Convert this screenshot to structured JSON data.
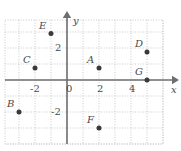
{
  "figure": {
    "type": "coordinate-plane-scatter",
    "axis_labels": {
      "x": "x",
      "y": "y"
    },
    "colors": {
      "grid": "#c9c9c9",
      "axis": "#6e6e6e",
      "point": "#3a3a3a",
      "label": "#4a4a4a",
      "background": "#ffffff"
    },
    "geometry": {
      "origin_px": {
        "x": 67,
        "y": 80
      },
      "unit_px": 16,
      "plot_left_px": 5,
      "plot_right_px": 163,
      "plot_top_px": 20,
      "plot_bottom_px": 144
    },
    "axis_ranges": {
      "x": [
        -4,
        6
      ],
      "y": [
        -4,
        4
      ]
    },
    "grid": "dotted",
    "x_ticks": [
      {
        "label": "-2",
        "value": -2
      },
      {
        "label": "0",
        "value": 0
      },
      {
        "label": "2",
        "value": 2
      },
      {
        "label": "4",
        "value": 4
      }
    ],
    "y_ticks": [
      {
        "label": "2",
        "value": 2
      },
      {
        "label": "-2",
        "value": -2
      }
    ],
    "points": [
      {
        "label": "A",
        "x": 2,
        "y": 0.75,
        "label_pos": "above-left"
      },
      {
        "label": "B",
        "x": -3,
        "y": -2,
        "label_pos": "above-left"
      },
      {
        "label": "C",
        "x": -2,
        "y": 0.75,
        "label_pos": "above-left"
      },
      {
        "label": "D",
        "x": 5,
        "y": 1.75,
        "label_pos": "above-left"
      },
      {
        "label": "E",
        "x": -1,
        "y": 2.9,
        "label_pos": "above-left"
      },
      {
        "label": "F",
        "x": 2,
        "y": -3,
        "label_pos": "above-left"
      },
      {
        "label": "G",
        "x": 5,
        "y": 0,
        "label_pos": "above-left"
      }
    ]
  }
}
